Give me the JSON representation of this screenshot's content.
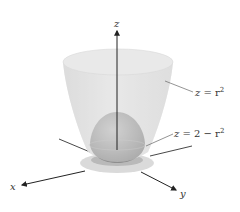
{
  "figure": {
    "axes": {
      "x_label": "x",
      "y_label": "y",
      "z_label": "z"
    },
    "surfaces": [
      {
        "id": "outer",
        "label_var": "z",
        "label_eq": " = r",
        "label_exp": "2",
        "description": "upward-opening paraboloid",
        "color": "#d4d4d4"
      },
      {
        "id": "inner",
        "label_var": "z",
        "label_eq": " = 2 − r",
        "label_exp": "2",
        "description": "downward-opening paraboloid dome",
        "color": "#9a9a9a"
      }
    ],
    "colors": {
      "axis": "#222222",
      "outer_fill": "#d9d9d9",
      "outer_rim": "#e6e6e6",
      "inner_fill": "#a6a6a6",
      "base": "#cfcfcf",
      "leader": "#666666"
    }
  }
}
